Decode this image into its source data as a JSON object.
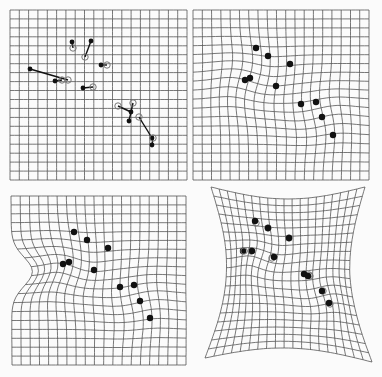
{
  "figure": {
    "width": 382,
    "height": 377,
    "colors": {
      "background": "#fbfbfb",
      "grid": "#555555",
      "landmark": "#111111",
      "source": "#777777"
    },
    "grid_cells": 19,
    "panels": [
      {
        "id": "panel-top-left",
        "label": "undeformed grid with displacement vectors",
        "corners": [
          [
            10,
            10
          ],
          [
            187,
            10
          ],
          [
            187,
            180
          ],
          [
            10,
            180
          ]
        ],
        "warp": "none",
        "show_vectors": true,
        "landmarks": [
          {
            "from": [
              73,
              48
            ],
            "to": [
              72,
              42
            ]
          },
          {
            "from": [
              85,
              57
            ],
            "to": [
              91,
              41
            ]
          },
          {
            "from": [
              107,
              65
            ],
            "to": [
              101,
              65
            ]
          },
          {
            "from": [
              68,
              80
            ],
            "to": [
              30,
              69
            ]
          },
          {
            "from": [
              62,
              80
            ],
            "to": [
              55,
              81
            ]
          },
          {
            "from": [
              93,
              87
            ],
            "to": [
              83,
              88
            ]
          },
          {
            "from": [
              118,
              106
            ],
            "to": [
              131,
              112
            ]
          },
          {
            "from": [
              133,
              103
            ],
            "to": [
              129,
              121
            ]
          },
          {
            "from": [
              139,
              117
            ],
            "to": [
              152,
              138
            ]
          },
          {
            "from": [
              153,
              138
            ],
            "to": [
              152,
              145
            ]
          }
        ]
      },
      {
        "id": "panel-top-right",
        "label": "warped grid (thin-plate spline)",
        "corners": [
          [
            193,
            10
          ],
          [
            369,
            10
          ],
          [
            369,
            180
          ],
          [
            193,
            180
          ]
        ],
        "warp": "landmark",
        "show_vectors": false,
        "landmarks": [
          {
            "from": [
              255,
              48
            ],
            "to": [
              256,
              48
            ]
          },
          {
            "from": [
              267,
              57
            ],
            "to": [
              268,
              56
            ]
          },
          {
            "from": [
              289,
              65
            ],
            "to": [
              290,
              64
            ]
          },
          {
            "from": [
              250,
              80
            ],
            "to": [
              245,
              80
            ]
          },
          {
            "from": [
              246,
              80
            ],
            "to": [
              250,
              78
            ]
          },
          {
            "from": [
              276,
              87
            ],
            "to": [
              276,
              86
            ]
          },
          {
            "from": [
              300,
              106
            ],
            "to": [
              301,
              104
            ]
          },
          {
            "from": [
              316,
              103
            ],
            "to": [
              316,
              102
            ]
          },
          {
            "from": [
              322,
              117
            ],
            "to": [
              322,
              117
            ]
          },
          {
            "from": [
              334,
              138
            ],
            "to": [
              333,
              135
            ]
          }
        ]
      },
      {
        "id": "panel-bottom-left",
        "label": "warped grid with distorted border",
        "corners": [
          [
            11,
            196
          ],
          [
            186,
            196
          ],
          [
            186,
            365
          ],
          [
            12,
            365
          ]
        ],
        "warp": "landmark-border",
        "show_vectors": false,
        "landmarks": [
          {
            "from": [
              74,
              232
            ],
            "to": [
              74,
              232
            ]
          },
          {
            "from": [
              86,
              240
            ],
            "to": [
              87,
              240
            ]
          },
          {
            "from": [
              108,
              248
            ],
            "to": [
              108,
              248
            ]
          },
          {
            "from": [
              66,
              264
            ],
            "to": [
              63,
              264
            ]
          },
          {
            "from": [
              60,
              264
            ],
            "to": [
              69,
              262
            ]
          },
          {
            "from": [
              94,
              270
            ],
            "to": [
              94,
              270
            ]
          },
          {
            "from": [
              120,
              287
            ],
            "to": [
              120,
              287
            ]
          },
          {
            "from": [
              133,
              285
            ],
            "to": [
              134,
              285
            ]
          },
          {
            "from": [
              139,
              301
            ],
            "to": [
              140,
              301
            ]
          },
          {
            "from": [
              150,
              318
            ],
            "to": [
              150,
              318
            ]
          }
        ]
      },
      {
        "id": "panel-bottom-right",
        "label": "warped grid with concave border",
        "corners": [
          [
            211,
            187
          ],
          [
            365,
            187
          ],
          [
            372,
            362
          ],
          [
            205,
            358
          ]
        ],
        "warp": "pinched",
        "show_vectors": false,
        "landmarks": [
          {
            "from": [
              256,
              223
            ],
            "to": [
              255,
              221
            ]
          },
          {
            "from": [
              268,
              228
            ],
            "to": [
              268,
              228
            ]
          },
          {
            "from": [
              289,
              238
            ],
            "to": [
              289,
              238
            ]
          },
          {
            "from": [
              251,
              251
            ],
            "to": [
              243,
              251
            ]
          },
          {
            "from": [
              244,
              251
            ],
            "to": [
              252,
              251
            ]
          },
          {
            "from": [
              272,
              258
            ],
            "to": [
              274,
              257
            ]
          },
          {
            "from": [
              309,
              275
            ],
            "to": [
              304,
              274
            ]
          },
          {
            "from": [
              310,
              276
            ],
            "to": [
              308,
              276
            ]
          },
          {
            "from": [
              323,
              291
            ],
            "to": [
              322,
              291
            ]
          },
          {
            "from": [
              330,
              304
            ],
            "to": [
              329,
              303
            ]
          }
        ]
      }
    ]
  }
}
